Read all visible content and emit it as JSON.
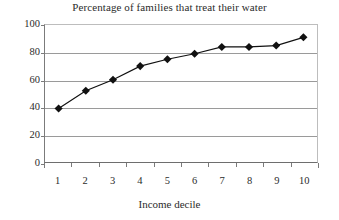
{
  "chart_data": {
    "type": "line",
    "title": "Percentage of families that treat their water",
    "xlabel": "Income decile",
    "ylabel": "",
    "categories": [
      "1",
      "2",
      "3",
      "4",
      "5",
      "6",
      "7",
      "8",
      "9",
      "10"
    ],
    "values": [
      39,
      52,
      60,
      70,
      75,
      79,
      84,
      84,
      85,
      91
    ],
    "series": [
      {
        "name": "Percentage of families that treat their water",
        "values": [
          39,
          52,
          60,
          70,
          75,
          79,
          84,
          84,
          85,
          91
        ]
      }
    ],
    "ylim": [
      0,
      100
    ],
    "y_ticks": [
      0,
      20,
      40,
      60,
      80,
      100
    ],
    "y_tick_labels": [
      "0",
      "20",
      "40",
      "60",
      "80",
      "100"
    ],
    "grid": true,
    "grid_axis": "y",
    "legend": false,
    "legend_position": "none",
    "marker": "diamond",
    "marker_color": "#111111",
    "line_color": "#111111",
    "plot_background": "#ffffff",
    "grid_color": "#9a9a9a",
    "axis_color": "#6e6e6e"
  }
}
